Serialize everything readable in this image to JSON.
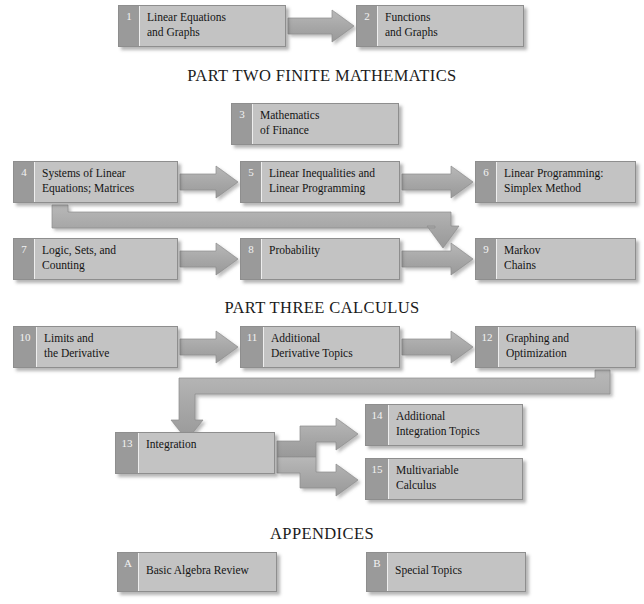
{
  "diagram": {
    "title_visible": false,
    "colors": {
      "box_body": "#c3c3c3",
      "box_number_tab": "#9a9a9a",
      "box_border": "#8e8e8e",
      "arrow_fill": "#a8a8a8",
      "arrow_stroke": "#8d8d8d",
      "text": "#141414",
      "background": "#ffffff"
    },
    "headings": [
      {
        "id": "part-two",
        "text": "PART TWO  FINITE MATHEMATICS",
        "x": 0,
        "y": 66
      },
      {
        "id": "part-three",
        "text": "PART THREE  CALCULUS",
        "x": 0,
        "y": 298
      },
      {
        "id": "appendices",
        "text": "APPENDICES",
        "x": 0,
        "y": 524
      }
    ],
    "boxes": [
      {
        "id": "ch1",
        "num": "1",
        "label": "Linear Equations\nand Graphs",
        "x": 118,
        "y": 5,
        "w": 168,
        "h": 42
      },
      {
        "id": "ch2",
        "num": "2",
        "label": "Functions\nand Graphs",
        "x": 356,
        "y": 5,
        "w": 168,
        "h": 42
      },
      {
        "id": "ch3",
        "num": "3",
        "label": "Mathematics\nof Finance",
        "x": 231,
        "y": 103,
        "w": 168,
        "h": 42
      },
      {
        "id": "ch4",
        "num": "4",
        "label": "Systems of Linear\nEquations; Matrices",
        "x": 13,
        "y": 161,
        "w": 165,
        "h": 42
      },
      {
        "id": "ch5",
        "num": "5",
        "label": "Linear Inequalities and\nLinear Programming",
        "x": 240,
        "y": 161,
        "w": 160,
        "h": 42
      },
      {
        "id": "ch6",
        "num": "6",
        "label": "Linear Programming:\nSimplex Method",
        "x": 475,
        "y": 161,
        "w": 161,
        "h": 42
      },
      {
        "id": "ch7",
        "num": "7",
        "label": "Logic, Sets, and\nCounting",
        "x": 13,
        "y": 238,
        "w": 165,
        "h": 42
      },
      {
        "id": "ch8",
        "num": "8",
        "label": "Probability",
        "x": 240,
        "y": 238,
        "w": 160,
        "h": 42
      },
      {
        "id": "ch9",
        "num": "9",
        "label": "Markov\nChains",
        "x": 475,
        "y": 238,
        "w": 161,
        "h": 42
      },
      {
        "id": "ch10",
        "num": "10",
        "label": "Limits and\nthe Derivative",
        "x": 13,
        "y": 326,
        "w": 165,
        "h": 42
      },
      {
        "id": "ch11",
        "num": "11",
        "label": "Additional\nDerivative Topics",
        "x": 240,
        "y": 326,
        "w": 160,
        "h": 42
      },
      {
        "id": "ch12",
        "num": "12",
        "label": "Graphing and\nOptimization",
        "x": 475,
        "y": 326,
        "w": 161,
        "h": 42
      },
      {
        "id": "ch13",
        "num": "13",
        "label": "Integration",
        "x": 115,
        "y": 432,
        "w": 160,
        "h": 42
      },
      {
        "id": "ch14",
        "num": "14",
        "label": "Additional\nIntegration Topics",
        "x": 365,
        "y": 404,
        "w": 158,
        "h": 42
      },
      {
        "id": "ch15",
        "num": "15",
        "label": "Multivariable\nCalculus",
        "x": 365,
        "y": 458,
        "w": 158,
        "h": 42
      },
      {
        "id": "appA",
        "num": "A",
        "label": "Basic Algebra Review",
        "x": 117,
        "y": 552,
        "w": 160,
        "h": 40
      },
      {
        "id": "appB",
        "num": "B",
        "label": "Special Topics",
        "x": 366,
        "y": 552,
        "w": 160,
        "h": 40
      }
    ],
    "arrows": [
      {
        "id": "a1-2",
        "from": "ch1",
        "to": "ch2",
        "kind": "straight-right"
      },
      {
        "id": "a4-5",
        "from": "ch4",
        "to": "ch5",
        "kind": "straight-right"
      },
      {
        "id": "a5-6",
        "from": "ch5",
        "to": "ch6",
        "kind": "straight-right"
      },
      {
        "id": "a4-9",
        "from": "ch4",
        "to": "ch9",
        "kind": "down-right-down"
      },
      {
        "id": "a7-8",
        "from": "ch7",
        "to": "ch8",
        "kind": "straight-right"
      },
      {
        "id": "a8-9",
        "from": "ch8",
        "to": "ch9",
        "kind": "straight-right"
      },
      {
        "id": "a10-11",
        "from": "ch10",
        "to": "ch11",
        "kind": "straight-right"
      },
      {
        "id": "a11-12",
        "from": "ch11",
        "to": "ch12",
        "kind": "straight-right"
      },
      {
        "id": "a12-13",
        "from": "ch12",
        "to": "ch13",
        "kind": "down-left-down"
      },
      {
        "id": "a13-14",
        "from": "ch13",
        "to": "ch14",
        "kind": "right-up-right"
      },
      {
        "id": "a13-15",
        "from": "ch13",
        "to": "ch15",
        "kind": "right-down-right"
      }
    ]
  }
}
